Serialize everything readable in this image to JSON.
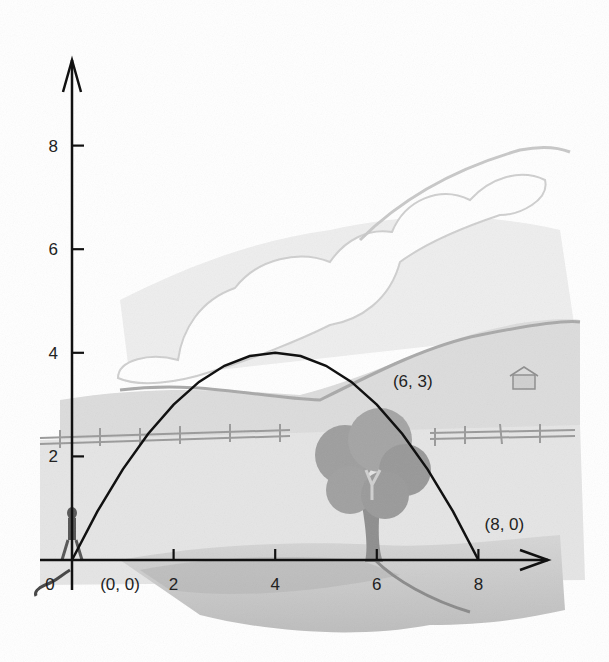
{
  "chart_data": {
    "type": "line",
    "title": "",
    "xlabel": "",
    "ylabel": "",
    "function": "y = -0.25x^2 + 2x",
    "xlim": [
      0,
      9.5
    ],
    "ylim": [
      0,
      10
    ],
    "x_ticks": [
      "0",
      "2",
      "4",
      "6",
      "8"
    ],
    "y_ticks": [
      "2",
      "4",
      "6",
      "8"
    ],
    "x_tick_values": [
      0,
      2,
      4,
      6,
      8
    ],
    "y_tick_values": [
      2,
      4,
      6,
      8
    ],
    "series": [
      {
        "name": "trajectory",
        "x": [
          0,
          0.5,
          1,
          1.5,
          2,
          2.5,
          3,
          3.5,
          4,
          4.5,
          5,
          5.5,
          6,
          6.5,
          7,
          7.5,
          8
        ],
        "y": [
          0,
          0.9375,
          1.75,
          2.4375,
          3,
          3.4375,
          3.75,
          3.9375,
          4,
          3.9375,
          3.75,
          3.4375,
          3,
          2.4375,
          1.75,
          0.9375,
          0
        ]
      }
    ],
    "annotations": [
      {
        "text": "(0, 0)",
        "x": 0,
        "y": 0
      },
      {
        "text": "(6, 3)",
        "x": 6,
        "y": 3
      },
      {
        "text": "(8, 0)",
        "x": 8,
        "y": 0
      }
    ],
    "grid": false,
    "background": "pencil sketch landscape: rolling hills, clouds, fence, tree, small barn, person at origin"
  },
  "colors": {
    "axis": "#111111",
    "curve": "#111111",
    "sketch_light": "#e6e6e6",
    "sketch_mid": "#c4c4c4",
    "sketch_dark": "#8a8a8a"
  }
}
